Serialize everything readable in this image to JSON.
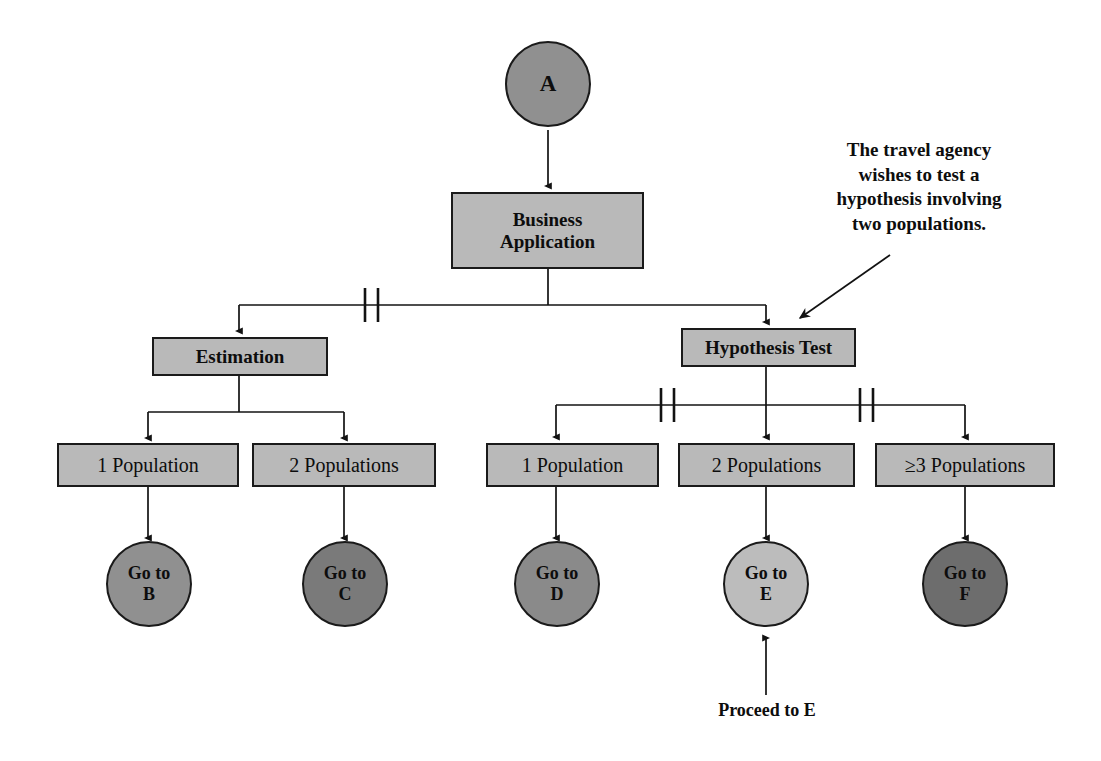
{
  "diagram": {
    "colors": {
      "box_fill": "#b9b9b9",
      "circle_mid": "#909090",
      "circle_dark": "#6d6d6d",
      "circle_light": "#b8b8b8",
      "stroke": "#1a1a1a",
      "background": "#ffffff"
    },
    "nodes": {
      "root": {
        "label": "A",
        "shape": "circle",
        "fill": "#909090"
      },
      "business_application": {
        "label_line1": "Business",
        "label_line2": "Application",
        "shape": "box",
        "fill": "#b9b9b9"
      },
      "estimation": {
        "label": "Estimation",
        "shape": "box",
        "fill": "#b9b9b9"
      },
      "hypothesis_test": {
        "label": "Hypothesis Test",
        "shape": "box",
        "fill": "#b9b9b9"
      },
      "est_1_population": {
        "label": "1 Population",
        "shape": "box",
        "fill": "#b9b9b9"
      },
      "est_2_populations": {
        "label": "2 Populations",
        "shape": "box",
        "fill": "#b9b9b9"
      },
      "ht_1_population": {
        "label": "1 Population",
        "shape": "box",
        "fill": "#b9b9b9"
      },
      "ht_2_populations": {
        "label": "2 Populations",
        "shape": "box",
        "fill": "#b9b9b9"
      },
      "ht_3_populations": {
        "label": "≥3 Populations",
        "shape": "box",
        "fill": "#b9b9b9"
      },
      "goto_b": {
        "label_line1": "Go to",
        "label_line2": "B",
        "shape": "circle",
        "fill": "#909090"
      },
      "goto_c": {
        "label_line1": "Go to",
        "label_line2": "C",
        "shape": "circle",
        "fill": "#7a7a7a"
      },
      "goto_d": {
        "label_line1": "Go to",
        "label_line2": "D",
        "shape": "circle",
        "fill": "#8a8a8a"
      },
      "goto_e": {
        "label_line1": "Go to",
        "label_line2": "E",
        "shape": "circle",
        "fill": "#bcbcbc"
      },
      "goto_f": {
        "label_line1": "Go to",
        "label_line2": "F",
        "shape": "circle",
        "fill": "#6d6d6d"
      }
    },
    "annotations": {
      "top_right": {
        "line1": "The travel agency",
        "line2": "wishes to test a",
        "line3": "hypothesis involving",
        "line4": "two populations."
      },
      "bottom": {
        "text": "Proceed to E"
      }
    }
  }
}
